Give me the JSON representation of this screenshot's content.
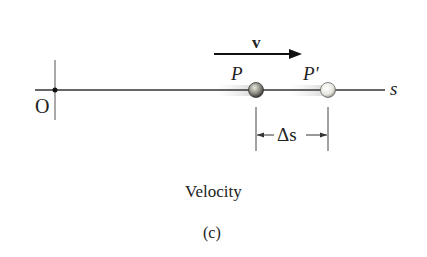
{
  "diagram": {
    "origin_label": "O",
    "axis_label": "s",
    "velocity_label": "v",
    "point_label": "P",
    "point_prime_label": "P'",
    "displacement_label": "Δs",
    "caption": "Velocity",
    "subfigure": "(c)"
  }
}
